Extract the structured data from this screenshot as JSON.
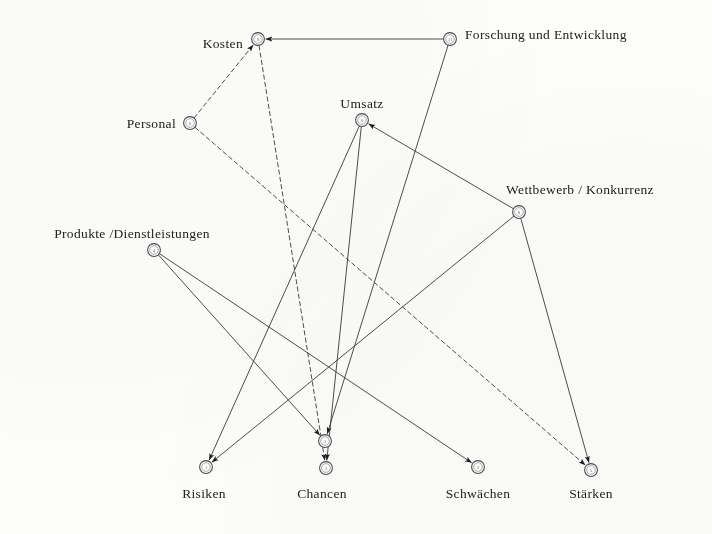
{
  "diagram": {
    "background_color": "#fdfdfc",
    "line_color": "#3a3a3a",
    "text_color": "#23211f",
    "width": 712,
    "height": 534
  },
  "nodes": [
    {
      "id": "kosten",
      "label": "Kosten",
      "x": 258,
      "y": 39,
      "marker": "9",
      "label_anchor": "left",
      "label_x": 243,
      "label_y": 44
    },
    {
      "id": "forschung",
      "label": "Forschung und  Entwicklung",
      "x": 450,
      "y": 39,
      "marker": "11",
      "label_anchor": "right",
      "label_x": 465,
      "label_y": 35
    },
    {
      "id": "umsatz",
      "label": "Umsatz",
      "x": 362,
      "y": 120,
      "marker": "6",
      "label_anchor": "center-above",
      "label_x": 362,
      "label_y": 110
    },
    {
      "id": "personal",
      "label": "Personal",
      "x": 190,
      "y": 123,
      "marker": "6",
      "label_anchor": "left",
      "label_x": 176,
      "label_y": 124
    },
    {
      "id": "wettbewerb",
      "label": "Wettbewerb / Konkurrenz",
      "x": 519,
      "y": 212,
      "marker": "8",
      "label_anchor": "center-above",
      "label_x": 580,
      "label_y": 196
    },
    {
      "id": "produkte",
      "label": "Produkte /Dienstleistungen",
      "x": 154,
      "y": 250,
      "marker": "4",
      "label_anchor": "center-above",
      "label_x": 132,
      "label_y": 240
    },
    {
      "id": "risiken",
      "label": "Risiken",
      "x": 206,
      "y": 467,
      "marker": "1",
      "label_anchor": "center",
      "label_x": 204,
      "label_y": 487
    },
    {
      "id": "chancen_up",
      "label": "",
      "x": 325,
      "y": 441,
      "marker": "3",
      "label_anchor": "none",
      "label_x": 0,
      "label_y": 0
    },
    {
      "id": "chancen",
      "label": "Chancen",
      "x": 326,
      "y": 468,
      "marker": "3",
      "label_anchor": "center",
      "label_x": 322,
      "label_y": 487
    },
    {
      "id": "schwaechen",
      "label": "Schwächen",
      "x": 478,
      "y": 467,
      "marker": "2",
      "label_anchor": "center",
      "label_x": 478,
      "label_y": 487
    },
    {
      "id": "staerken",
      "label": "Stärken",
      "x": 591,
      "y": 470,
      "marker": "5",
      "label_anchor": "center",
      "label_x": 591,
      "label_y": 487
    }
  ],
  "edges": [
    {
      "from": "forschung",
      "to": "kosten",
      "style": "solid",
      "arrow": true
    },
    {
      "from": "personal",
      "to": "kosten",
      "style": "dashed",
      "arrow": true
    },
    {
      "from": "wettbewerb",
      "to": "umsatz",
      "style": "solid",
      "arrow": true
    },
    {
      "from": "kosten",
      "to": "chancen",
      "style": "dashed",
      "arrow": true
    },
    {
      "from": "forschung",
      "to": "chancen_up",
      "style": "solid",
      "arrow": true
    },
    {
      "from": "umsatz",
      "to": "risiken",
      "style": "solid",
      "arrow": true
    },
    {
      "from": "umsatz",
      "to": "chancen",
      "style": "solid",
      "arrow": true
    },
    {
      "from": "personal",
      "to": "staerken",
      "style": "dashed",
      "arrow": true
    },
    {
      "from": "produkte",
      "to": "chancen_up",
      "style": "solid",
      "arrow": true
    },
    {
      "from": "produkte",
      "to": "schwaechen",
      "style": "solid",
      "arrow": true
    },
    {
      "from": "wettbewerb",
      "to": "risiken",
      "style": "solid",
      "arrow": true
    },
    {
      "from": "wettbewerb",
      "to": "staerken",
      "style": "solid",
      "arrow": true
    }
  ]
}
